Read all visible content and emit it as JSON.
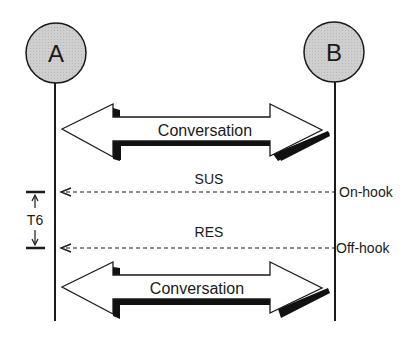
{
  "diagram": {
    "type": "sequence",
    "endpoints": [
      {
        "id": "A",
        "label": "A"
      },
      {
        "id": "B",
        "label": "B"
      }
    ],
    "phases": [
      {
        "label": "Conversation",
        "kind": "bidirectional"
      },
      {
        "label": "Conversation",
        "kind": "bidirectional"
      }
    ],
    "messages": [
      {
        "label": "SUS",
        "from": "B",
        "to": "A",
        "style": "dashed",
        "event": "On-hook"
      },
      {
        "label": "RES",
        "from": "B",
        "to": "A",
        "style": "dashed",
        "event": "Off-hook"
      }
    ],
    "timer": {
      "label": "T6"
    }
  },
  "colors": {
    "node_fill": "#c8c8c8",
    "line": "#1a1a1a",
    "shadow": "#111111"
  }
}
